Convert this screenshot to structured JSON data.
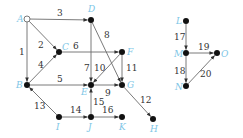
{
  "diagram": {
    "type": "directed-graph",
    "colors": {
      "edge": "#6b6b6b",
      "node": "#111111",
      "node_label": "#7ec6e6",
      "edge_label": "#333333"
    },
    "nodes": [
      {
        "id": "A",
        "label": "A",
        "x": 27,
        "y": 19,
        "hollow": true,
        "lx": 17,
        "ly": 22
      },
      {
        "id": "D",
        "label": "D",
        "x": 91,
        "y": 20,
        "hollow": false,
        "lx": 88,
        "ly": 12
      },
      {
        "id": "C",
        "label": "C",
        "x": 59,
        "y": 52,
        "hollow": false,
        "lx": 62,
        "ly": 50
      },
      {
        "id": "F",
        "label": "F",
        "x": 122,
        "y": 52,
        "hollow": false,
        "lx": 127,
        "ly": 55
      },
      {
        "id": "B",
        "label": "B",
        "x": 27,
        "y": 85,
        "hollow": false,
        "lx": 16,
        "ly": 88
      },
      {
        "id": "E",
        "label": "E",
        "x": 91,
        "y": 85,
        "hollow": false,
        "lx": 81,
        "ly": 95
      },
      {
        "id": "G",
        "label": "G",
        "x": 122,
        "y": 85,
        "hollow": false,
        "lx": 127,
        "ly": 88
      },
      {
        "id": "I",
        "label": "I",
        "x": 59,
        "y": 117,
        "hollow": false,
        "lx": 56,
        "ly": 130
      },
      {
        "id": "J",
        "label": "J",
        "x": 91,
        "y": 117,
        "hollow": false,
        "lx": 88,
        "ly": 130
      },
      {
        "id": "K",
        "label": "K",
        "x": 122,
        "y": 117,
        "hollow": false,
        "lx": 119,
        "ly": 130
      },
      {
        "id": "H",
        "label": "H",
        "x": 153,
        "y": 119,
        "hollow": false,
        "lx": 150,
        "ly": 132
      },
      {
        "id": "L",
        "label": "L",
        "x": 186,
        "y": 21,
        "hollow": false,
        "lx": 176,
        "ly": 24
      },
      {
        "id": "M",
        "label": "M",
        "x": 186,
        "y": 53,
        "hollow": false,
        "lx": 174,
        "ly": 57
      },
      {
        "id": "N",
        "label": "N",
        "x": 186,
        "y": 86,
        "hollow": false,
        "lx": 175,
        "ly": 90
      },
      {
        "id": "O",
        "label": "O",
        "x": 217,
        "y": 53,
        "hollow": false,
        "lx": 221,
        "ly": 57
      }
    ],
    "edges": [
      {
        "label": "1",
        "from": "A",
        "to": "B",
        "lx": 19,
        "ly": 55
      },
      {
        "label": "2",
        "from": "A",
        "to": "C",
        "lx": 38,
        "ly": 48
      },
      {
        "label": "3",
        "from": "A",
        "to": "D",
        "lx": 57,
        "ly": 16
      },
      {
        "label": "4",
        "from": "B",
        "to": "C",
        "lx": 38,
        "ly": 68
      },
      {
        "label": "5",
        "from": "B",
        "to": "E",
        "lx": 57,
        "ly": 82
      },
      {
        "label": "6",
        "from": "C",
        "to": "F",
        "lx": 73,
        "ly": 49
      },
      {
        "label": "7",
        "from": "D",
        "to": "E",
        "lx": 84,
        "ly": 71
      },
      {
        "label": "8",
        "from": "D",
        "to": "G",
        "lx": 104,
        "ly": 38
      },
      {
        "label": "9",
        "from": "E",
        "to": "G",
        "lx": 105,
        "ly": 96
      },
      {
        "label": "10",
        "from": "F",
        "to": "E",
        "lx": 94,
        "ly": 71
      },
      {
        "label": "11",
        "from": "F",
        "to": "G",
        "lx": 126,
        "ly": 71
      },
      {
        "label": "12",
        "from": "G",
        "to": "H",
        "lx": 140,
        "ly": 103
      },
      {
        "label": "13",
        "from": "I",
        "to": "B",
        "lx": 34,
        "ly": 109
      },
      {
        "label": "14",
        "from": "I",
        "to": "J",
        "lx": 70,
        "ly": 113
      },
      {
        "label": "15",
        "from": "J",
        "to": "E",
        "lx": 93,
        "ly": 105
      },
      {
        "label": "16",
        "from": "J",
        "to": "K",
        "lx": 102,
        "ly": 113
      },
      {
        "label": "17",
        "from": "L",
        "to": "M",
        "lx": 174,
        "ly": 40
      },
      {
        "label": "18",
        "from": "M",
        "to": "N",
        "lx": 174,
        "ly": 74
      },
      {
        "label": "19",
        "from": "M",
        "to": "O",
        "lx": 198,
        "ly": 50
      },
      {
        "label": "20",
        "from": "N",
        "to": "O",
        "lx": 200,
        "ly": 77
      }
    ]
  }
}
